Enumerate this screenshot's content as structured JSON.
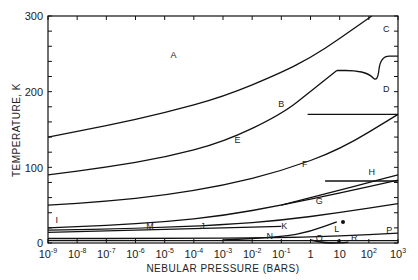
{
  "chart_data": {
    "type": "line",
    "title": "",
    "xlabel": "NEBULAR PRESSURE (BARS)",
    "ylabel": "TEMPERATURE, K",
    "xscale": "log",
    "xlim": [
      1e-09,
      1000
    ],
    "ylim": [
      0,
      300
    ],
    "grid": false,
    "legend": "none",
    "x_tick_labels": [
      "10^-9",
      "10^-8",
      "10^-7",
      "10^-6",
      "10^-5",
      "10^-4",
      "10^-3",
      "10^-2",
      "10^-1",
      "1",
      "10",
      "10^2",
      "10^3"
    ],
    "y_tick_labels": [
      "0",
      "100",
      "200",
      "300"
    ],
    "region_labels": [
      {
        "label": "A",
        "log_p": -4.7,
        "T": 245
      },
      {
        "label": "B",
        "log_p": -1.0,
        "T": 180
      },
      {
        "label": "C",
        "log_p": 2.6,
        "T": 279
      },
      {
        "label": "D",
        "log_p": 2.6,
        "T": 200
      },
      {
        "label": "E",
        "log_p": -2.5,
        "T": 132
      },
      {
        "label": "F",
        "log_p": -0.2,
        "T": 100
      },
      {
        "label": "G",
        "log_p": 0.3,
        "T": 52
      },
      {
        "label": "H",
        "log_p": 2.1,
        "T": 90
      },
      {
        "label": "I",
        "log_p": -8.7,
        "T": 26
      },
      {
        "label": "J",
        "log_p": -3.7,
        "T": 18
      },
      {
        "label": "K",
        "log_p": -0.9,
        "T": 18
      },
      {
        "label": "L",
        "log_p": 0.9,
        "T": 15
      },
      {
        "label": "M",
        "log_p": -5.5,
        "T": 18
      },
      {
        "label": "N",
        "log_p": -1.4,
        "T": 5
      },
      {
        "label": "P",
        "log_p": 2.7,
        "T": 13
      },
      {
        "label": "Q",
        "log_p": 0.3,
        "T": 2
      },
      {
        "label": "R",
        "log_p": 1.5,
        "T": 3
      }
    ],
    "series": [
      {
        "name": "A/B boundary",
        "log_p": [
          -9,
          -7,
          -5,
          -3,
          -1,
          0,
          1,
          2.1
        ],
        "T": [
          140,
          155,
          172,
          193,
          225,
          245,
          270,
          300
        ]
      },
      {
        "name": "B/E boundary",
        "log_p": [
          -9,
          -7,
          -5,
          -3,
          -1,
          0,
          0.9
        ],
        "T": [
          90,
          100,
          113,
          133,
          170,
          200,
          228
        ]
      },
      {
        "name": "C/D boundary",
        "log_p": [
          0.9,
          1.5,
          2.0,
          2.3,
          2.4,
          3
        ],
        "T": [
          228,
          228,
          224,
          212,
          247,
          247
        ]
      },
      {
        "name": "D/E boundary",
        "log_p": [
          -0.1,
          1,
          2,
          3
        ],
        "T": [
          170,
          170,
          170,
          170
        ]
      },
      {
        "name": "E/F boundary",
        "log_p": [
          -9,
          -7,
          -5,
          -3,
          -1,
          1,
          3
        ],
        "T": [
          50,
          55,
          63,
          76,
          95,
          123,
          170
        ]
      },
      {
        "name": "F/G boundary",
        "log_p": [
          -9,
          -7,
          -5,
          -3,
          -1,
          1,
          3
        ],
        "T": [
          20,
          23,
          28,
          36,
          50,
          66,
          83
        ]
      },
      {
        "name": "G/H boundary",
        "log_p": [
          0.5,
          1.5,
          2.5,
          3
        ],
        "T": [
          82,
          82,
          82,
          82
        ]
      },
      {
        "name": "H upper",
        "log_p": [
          -1,
          1,
          2,
          3
        ],
        "T": [
          50,
          70,
          80,
          90
        ]
      },
      {
        "name": "I upper",
        "log_p": [
          -9,
          -6,
          -3,
          -1,
          1,
          3
        ],
        "T": [
          17,
          19,
          24,
          30,
          40,
          52
        ]
      },
      {
        "name": "I/J",
        "log_p": [
          -9,
          -7,
          -5,
          -3,
          -1
        ],
        "T": [
          14,
          16,
          18,
          20,
          22
        ]
      },
      {
        "name": "K/L",
        "log_p": [
          -3,
          -1,
          0,
          0.9
        ],
        "T": [
          4,
          8,
          15,
          28
        ]
      },
      {
        "name": "N upper",
        "log_p": [
          -9,
          -5,
          -1,
          1,
          3
        ],
        "T": [
          6,
          6,
          7,
          9,
          13
        ]
      },
      {
        "name": "N lower",
        "log_p": [
          -9,
          -5,
          -1,
          3
        ],
        "T": [
          3,
          3,
          3,
          3
        ]
      },
      {
        "name": "Q/R",
        "log_p": [
          0,
          0.5,
          1,
          1.3
        ],
        "T": [
          4,
          0,
          0,
          1
        ]
      }
    ]
  }
}
